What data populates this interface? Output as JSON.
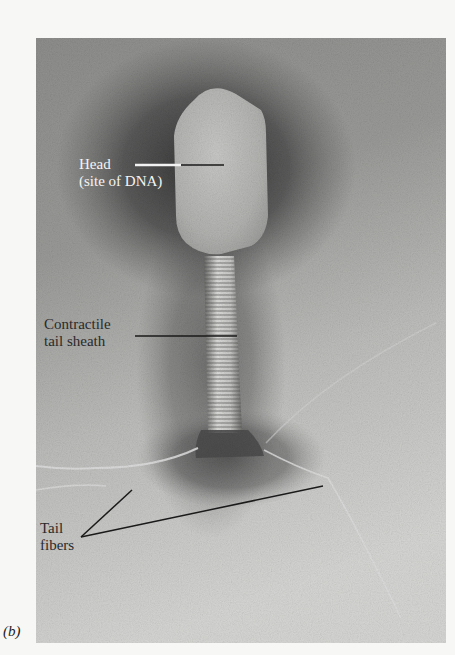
{
  "figure": {
    "panel_letter": "(b)",
    "labels": {
      "head_line1": "Head",
      "head_line2": "(site of DNA)",
      "sheath_line1": "Contractile",
      "sheath_line2": "tail sheath",
      "fibers_line1": "Tail",
      "fibers_line2": "fibers"
    },
    "colors": {
      "background_page": "#f7f7f5",
      "micrograph_dark": "#4a4a4a",
      "micrograph_light": "#d4d4d2",
      "label_light": "#f4f4f2",
      "label_dark": "#2a2a2a",
      "leader_line": "#1a1a1a"
    }
  }
}
